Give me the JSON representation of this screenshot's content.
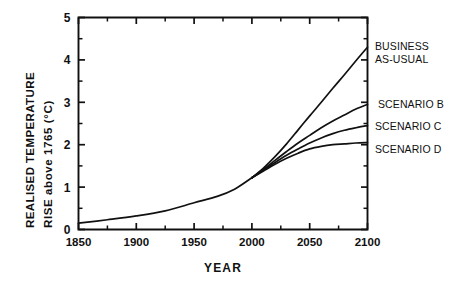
{
  "chart_data": {
    "type": "line",
    "title": "",
    "xlabel": "YEAR",
    "ylabel_line1": "REALISED  TEMPERATURE",
    "ylabel_line2": "RISE  above  1765  (°C)",
    "xlim": [
      1850,
      2100
    ],
    "ylim": [
      0,
      5
    ],
    "x_ticks_major": [
      1850,
      1900,
      1950,
      2000,
      2050,
      2100
    ],
    "x_tick_labels": [
      "1850",
      "1900",
      "1950",
      "2000",
      "2050",
      "2100"
    ],
    "x_ticks_minor": [
      1875,
      1925,
      1975,
      2025,
      2075
    ],
    "y_ticks_major": [
      0,
      1,
      2,
      3,
      4,
      5
    ],
    "y_tick_labels": [
      "0",
      "1",
      "2",
      "3",
      "4",
      "5"
    ],
    "y_ticks_minor": [
      0.5,
      1.5,
      2.5,
      3.5,
      4.5
    ],
    "grid": false,
    "legend_position": "right-inline-labels",
    "historical": {
      "name": "historical",
      "x": [
        1850,
        1875,
        1900,
        1925,
        1950,
        1970,
        1985,
        2000
      ],
      "y": [
        0.15,
        0.23,
        0.32,
        0.44,
        0.63,
        0.78,
        0.95,
        1.22
      ]
    },
    "series": [
      {
        "name": "BUSINESS AS-USUAL",
        "label": "BUSINESS\nAS-USUAL",
        "x": [
          2000,
          2010,
          2020,
          2030,
          2040,
          2050,
          2060,
          2070,
          2080,
          2090,
          2100
        ],
        "y": [
          1.22,
          1.45,
          1.72,
          2.02,
          2.35,
          2.68,
          3.0,
          3.33,
          3.65,
          3.98,
          4.3
        ]
      },
      {
        "name": "SCENARIO B",
        "label": "SCENARIO B",
        "x": [
          2000,
          2010,
          2020,
          2030,
          2040,
          2050,
          2060,
          2070,
          2080,
          2090,
          2100
        ],
        "y": [
          1.22,
          1.42,
          1.63,
          1.84,
          2.04,
          2.22,
          2.4,
          2.56,
          2.7,
          2.84,
          2.95
        ]
      },
      {
        "name": "SCENARIO C",
        "label": "SCENARIO C",
        "x": [
          2000,
          2010,
          2020,
          2030,
          2040,
          2050,
          2060,
          2070,
          2080,
          2090,
          2100
        ],
        "y": [
          1.22,
          1.4,
          1.58,
          1.75,
          1.9,
          2.04,
          2.16,
          2.26,
          2.34,
          2.4,
          2.45
        ]
      },
      {
        "name": "SCENARIO D",
        "label": "SCENARIO D",
        "x": [
          2000,
          2010,
          2020,
          2030,
          2040,
          2050,
          2060,
          2070,
          2080,
          2090,
          2100
        ],
        "y": [
          1.22,
          1.38,
          1.54,
          1.68,
          1.8,
          1.9,
          1.96,
          2.0,
          2.02,
          2.04,
          2.05
        ]
      }
    ]
  },
  "annotations": {
    "bau_line1": "BUSINESS",
    "bau_line2": "AS-USUAL",
    "scenario_b": "SCENARIO B",
    "scenario_c": "SCENARIO C",
    "scenario_d": "SCENARIO D"
  },
  "axis": {
    "x_title": "YEAR",
    "y_title_line1": "REALISED  TEMPERATURE",
    "y_title_line2": "RISE  above  1765  (°C)"
  },
  "colors": {
    "line": "#111111",
    "axis": "#101010",
    "background": "#ffffff"
  }
}
